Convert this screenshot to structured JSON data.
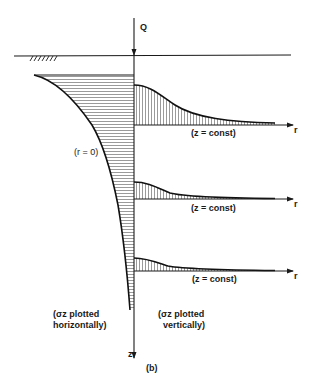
{
  "figure": {
    "caption": "(b)",
    "load_label": "Q",
    "r_axis_label": "r",
    "z_axis_label": "z",
    "r0_label": "(r = 0)",
    "zconst_labels": [
      "(z = const)",
      "(z = const)",
      "(z = const)"
    ],
    "left_annotation": {
      "line1": "(σz plotted",
      "line2": "horizontally)"
    },
    "right_annotation": {
      "line1": "(σz plotted",
      "line2": "vertically)"
    },
    "ground_symbol": "ground-hatch",
    "colors": {
      "ink": "#1a1a1a",
      "background": "#ffffff"
    }
  }
}
